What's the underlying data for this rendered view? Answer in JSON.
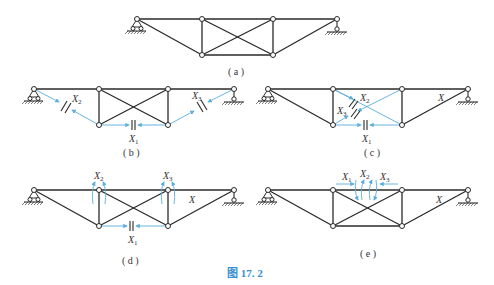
{
  "top_fragment": "",
  "figure_caption": "图 17. 2",
  "subfigures": [
    {
      "id": "a",
      "caption": "( a )",
      "labels": []
    },
    {
      "id": "b",
      "caption": "( b )",
      "labels": [
        "X2",
        "X3",
        "X1"
      ]
    },
    {
      "id": "c",
      "caption": "( c )",
      "labels": [
        "X2",
        "X3",
        "X1",
        "X"
      ]
    },
    {
      "id": "d",
      "caption": "( d )",
      "labels": [
        "X2",
        "X3",
        "X1",
        "X"
      ]
    },
    {
      "id": "e",
      "caption": "( e )",
      "labels": [
        "X1",
        "X2",
        "X3",
        "X"
      ]
    }
  ],
  "colors": {
    "member": "#2a2a2a",
    "redundant": "#5aaedc",
    "caption": "#3a8fd0"
  }
}
